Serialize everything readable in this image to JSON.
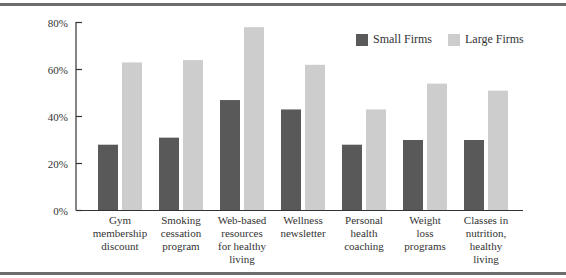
{
  "chart_data": {
    "type": "bar",
    "title": "",
    "xlabel": "",
    "ylabel": "",
    "ylim": [
      0,
      80
    ],
    "yticks": [
      "0%",
      "20%",
      "40%",
      "60%",
      "80%"
    ],
    "grid": false,
    "legend_position": "top-right",
    "categories": [
      "Gym membership discount",
      "Smoking cessation program",
      "Web-based resources for healthy living",
      "Wellness newsletter",
      "Personal health coaching",
      "Weight loss programs",
      "Classes in nutrition, healthy living"
    ],
    "category_lines": [
      [
        "Gym",
        "membership",
        "discount"
      ],
      [
        "Smoking",
        "cessation",
        "program"
      ],
      [
        "Web-based",
        "resources",
        "for healthy",
        "living"
      ],
      [
        "Wellness",
        "newsletter"
      ],
      [
        "Personal",
        "health",
        "coaching"
      ],
      [
        "Weight",
        "loss",
        "programs"
      ],
      [
        "Classes in",
        "nutrition,",
        "healthy",
        "living"
      ]
    ],
    "series": [
      {
        "name": "Small Firms",
        "color": "#595959",
        "values": [
          28,
          31,
          47,
          43,
          28,
          30,
          30
        ]
      },
      {
        "name": "Large Firms",
        "color": "#cdcdcd",
        "values": [
          63,
          64,
          78,
          62,
          43,
          54,
          51
        ]
      }
    ]
  },
  "legend": {
    "small_label": "Small Firms",
    "large_label": "Large Firms"
  }
}
